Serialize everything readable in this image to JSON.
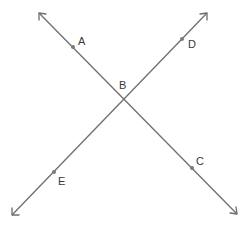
{
  "diagram": {
    "type": "intersecting-lines",
    "lines": [
      {
        "name": "line-AC",
        "through": [
          "A",
          "B",
          "C"
        ],
        "arrows_both_ends": true
      },
      {
        "name": "line-DE",
        "through": [
          "D",
          "B",
          "E"
        ],
        "arrows_both_ends": true
      }
    ],
    "points": [
      {
        "id": "A",
        "label": "A"
      },
      {
        "id": "B",
        "label": "B",
        "intersection": true
      },
      {
        "id": "C",
        "label": "C"
      },
      {
        "id": "D",
        "label": "D"
      },
      {
        "id": "E",
        "label": "E"
      }
    ],
    "colors": {
      "line": "#6e6e6e",
      "point": "#7a7a7a",
      "label": "#3a3a3a",
      "background": "#ffffff"
    }
  }
}
